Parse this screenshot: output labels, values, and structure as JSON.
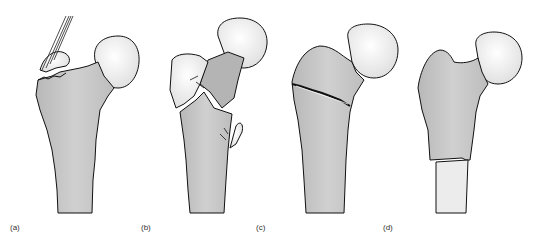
{
  "figure": {
    "panels": [
      {
        "label": "(a)",
        "description": "avulsion fracture of greater trochanter with muscle tendon pulling fragment"
      },
      {
        "label": "(b)",
        "description": "comminuted intertrochanteric fracture with displaced fragments"
      },
      {
        "label": "(c)",
        "description": "intertrochanteric fracture line across proximal femur"
      },
      {
        "label": "(d)",
        "description": "subtrochanteric transverse fracture with displaced shaft"
      }
    ],
    "colors": {
      "bone_fill": "#c8c8c8",
      "head_fill": "#f0f0f0",
      "outline": "#111111",
      "background": "#ffffff"
    }
  }
}
